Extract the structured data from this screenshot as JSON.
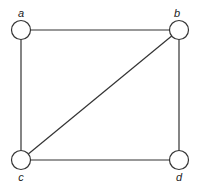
{
  "graph": {
    "nodes": [
      {
        "id": "a",
        "label": "a",
        "x": 21,
        "y": 30,
        "label_x": 21,
        "label_y": 17
      },
      {
        "id": "b",
        "label": "b",
        "x": 179,
        "y": 30,
        "label_x": 177,
        "label_y": 17
      },
      {
        "id": "c",
        "label": "c",
        "x": 21,
        "y": 160,
        "label_x": 21,
        "label_y": 181
      },
      {
        "id": "d",
        "label": "d",
        "x": 179,
        "y": 160,
        "label_x": 179,
        "label_y": 181
      }
    ],
    "edges": [
      {
        "from": "a",
        "to": "b"
      },
      {
        "from": "a",
        "to": "c"
      },
      {
        "from": "b",
        "to": "c"
      },
      {
        "from": "b",
        "to": "d"
      },
      {
        "from": "c",
        "to": "d"
      }
    ]
  }
}
